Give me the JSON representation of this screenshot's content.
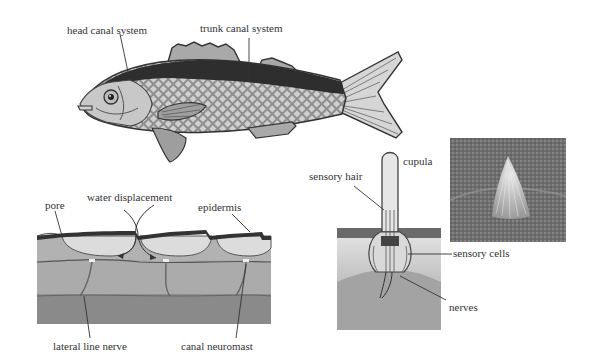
{
  "diagram": {
    "fish": {
      "labels": {
        "head_canal": "head canal system",
        "trunk_canal": "trunk canal system"
      }
    },
    "canal_section": {
      "labels": {
        "pore": "pore",
        "water_displacement": "water displacement",
        "epidermis": "epidermis",
        "lateral_line_nerve": "lateral line nerve",
        "canal_neuromast": "canal neuromast"
      }
    },
    "neuromast": {
      "labels": {
        "sensory_hair": "sensory hair",
        "cupula": "cupula",
        "sensory_cells": "sensory cells",
        "nerves": "nerves"
      }
    },
    "photo": {
      "description": "micrograph of neuromast cupula"
    },
    "colors": {
      "ink": "#333333",
      "dark_back": "#2e2e2e",
      "scale_fill": "#9a9a9a",
      "fin_fill": "#bdbdbd",
      "head_fill": "#c8c8c8",
      "skin_light": "#d9d9d9",
      "tissue_mid": "#a8a8a8",
      "tissue_dark": "#8a8a8a"
    }
  }
}
